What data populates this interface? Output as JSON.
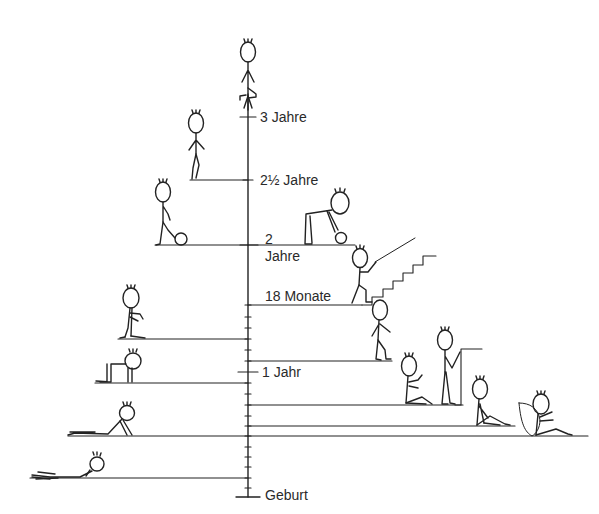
{
  "diagram": {
    "type": "developmental-milestones-timeline",
    "axis": {
      "direction": "vertical",
      "labels": [
        {
          "id": "geburt",
          "text": "Geburt"
        },
        {
          "id": "1jahr",
          "text": "1 Jahr"
        },
        {
          "id": "18monate",
          "text": "18 Monate"
        },
        {
          "id": "2jahre_num",
          "text": "2"
        },
        {
          "id": "2jahre_word",
          "text": "Jahre"
        },
        {
          "id": "2halbjahre",
          "text": "2½ Jahre"
        },
        {
          "id": "3jahre",
          "text": "3 Jahre"
        }
      ]
    },
    "milestones": [
      {
        "id": "lying-prone-head-up",
        "side": "left"
      },
      {
        "id": "prone-on-forearms",
        "side": "left"
      },
      {
        "id": "sitting-supported",
        "side": "right"
      },
      {
        "id": "sitting-unsupported",
        "side": "right"
      },
      {
        "id": "crawling",
        "side": "left"
      },
      {
        "id": "sitting-playing",
        "side": "right"
      },
      {
        "id": "pulling-to-stand",
        "side": "right"
      },
      {
        "id": "kneeling",
        "side": "left"
      },
      {
        "id": "walking",
        "side": "right"
      },
      {
        "id": "climbing-stairs",
        "side": "right"
      },
      {
        "id": "bending-to-pick-up-ball",
        "side": "right"
      },
      {
        "id": "kicking-ball",
        "side": "left"
      },
      {
        "id": "walking-on-tiptoe",
        "side": "left"
      },
      {
        "id": "standing-on-one-leg",
        "side": "center"
      }
    ]
  }
}
